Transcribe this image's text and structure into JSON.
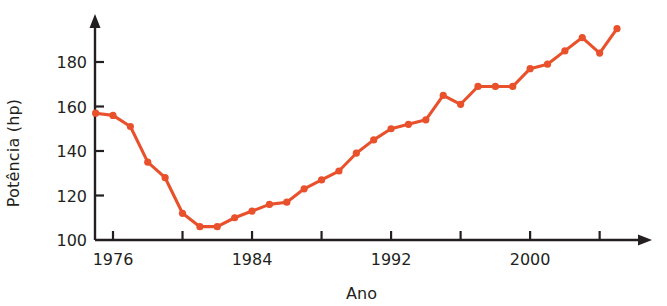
{
  "chart_data": {
    "type": "line",
    "title": "",
    "xlabel": "Ano",
    "ylabel": "Potência (hp)",
    "series_color": "#E8512B",
    "xlim": [
      1974.8,
      2005.6
    ],
    "ylim": [
      100,
      197
    ],
    "grid": false,
    "legend": null,
    "y_ticks": [
      100,
      120,
      140,
      160,
      180
    ],
    "y_tick_labels": [
      "100",
      "120",
      "140",
      "160",
      "180"
    ],
    "x_ticks": [
      1976,
      1980,
      1984,
      1988,
      1992,
      1996,
      2000,
      2004
    ],
    "x_tick_labels": [
      "1976",
      "",
      "1984",
      "",
      "1992",
      "",
      "2000",
      ""
    ],
    "x_minor_ticks": [
      1975,
      1976,
      1977,
      1978,
      1979,
      1980,
      1981,
      1982,
      1983,
      1984,
      1985,
      1986,
      1987,
      1988,
      1989,
      1990,
      1991,
      1992,
      1993,
      1994,
      1995,
      1996,
      1997,
      1998,
      1999,
      2000,
      2001,
      2002,
      2003,
      2004,
      2005
    ],
    "axis_arrows": [
      "top",
      "right"
    ],
    "marker": "circle",
    "x": [
      1975,
      1976,
      1977,
      1978,
      1979,
      1980,
      1981,
      1982,
      1983,
      1984,
      1985,
      1986,
      1987,
      1988,
      1989,
      1990,
      1991,
      1992,
      1993,
      1994,
      1995,
      1996,
      1997,
      1998,
      1999,
      2000,
      2001,
      2002,
      2003,
      2004,
      2005
    ],
    "values": [
      157,
      156,
      151,
      135,
      128,
      112,
      106,
      106,
      110,
      113,
      116,
      117,
      123,
      127,
      131,
      139,
      145,
      150,
      152,
      154,
      165,
      161,
      169,
      169,
      169,
      177,
      179,
      185,
      191,
      184,
      195
    ],
    "series": [
      {
        "name": "Potência",
        "values": [
          157,
          156,
          151,
          135,
          128,
          112,
          106,
          106,
          110,
          113,
          116,
          117,
          123,
          127,
          131,
          139,
          145,
          150,
          152,
          154,
          165,
          161,
          169,
          169,
          169,
          177,
          179,
          185,
          191,
          184,
          195
        ]
      }
    ]
  },
  "axes": {
    "y_axis_name": "Potência (hp)",
    "x_axis_name": "Ano"
  }
}
